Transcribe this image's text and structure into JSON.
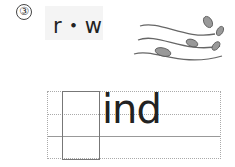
{
  "exercise": {
    "number": "③",
    "hint_letters": "r・w",
    "word_suffix": "ind",
    "answer_blank": "",
    "illustration": "wind-leaves-icon"
  }
}
